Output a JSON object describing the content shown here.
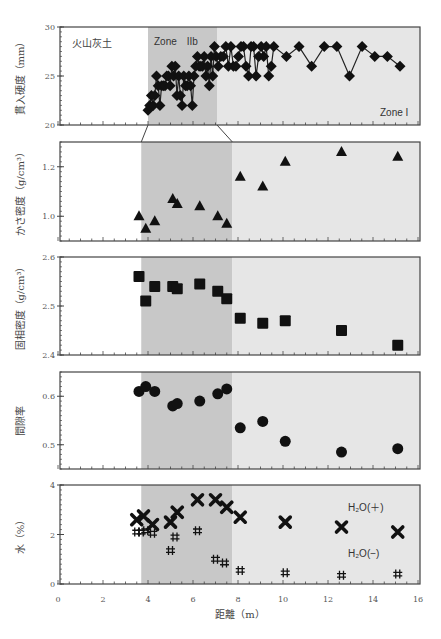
{
  "figure": {
    "xlabel": "距離（m）",
    "x_ticks": [
      "0",
      "2",
      "4",
      "6",
      "8",
      "10",
      "12",
      "14",
      "16"
    ],
    "annotations": {
      "soil_label": "火山灰土",
      "zone_2b": "Zone　IIb",
      "zone_1": "Zone I",
      "h2o_plus": "H₂O(＋)",
      "h2o_minus": "H₂O(−)"
    },
    "colors": {
      "zone_2b_fill": "#c8c8c8",
      "zone_1_fill": "#e6e6e6",
      "marker": "#111111"
    }
  },
  "chart_data": [
    {
      "type": "line",
      "title": "",
      "ylabel": "貫入硬度（mm）",
      "ylim": [
        20,
        30
      ],
      "y_ticks": [
        "20",
        "25",
        "30"
      ],
      "note": "Expanded x-scale (approx. 3.7–16 m) showing detailed profile",
      "series": [
        {
          "name": "貫入硬度",
          "marker": "diamond",
          "x": [
            3.7,
            3.8,
            3.9,
            4.0,
            4.1,
            4.2,
            4.3,
            4.4,
            4.5,
            4.6,
            4.7,
            4.8,
            4.9,
            5.0,
            5.1,
            5.2,
            5.3,
            5.4,
            5.5,
            5.6,
            5.7,
            5.8,
            5.9,
            6.0,
            6.1,
            6.2,
            6.3,
            6.4,
            6.5,
            6.6,
            6.7,
            6.8,
            6.9,
            7.0,
            7.1,
            7.2,
            7.3,
            7.4,
            7.5,
            7.6,
            7.7,
            7.8,
            7.9,
            8.0,
            8.1,
            8.2,
            8.3,
            8.4,
            8.5,
            8.6,
            8.7,
            8.8,
            8.9,
            9.0,
            9.1,
            9.2,
            9.3,
            9.4,
            9.5,
            9.6,
            9.7,
            9.8,
            9.9,
            10.0,
            10.5,
            11.0,
            11.5,
            12.0,
            12.5,
            13.0,
            13.5,
            14.0,
            14.5,
            15.0
          ],
          "values": [
            21.5,
            22,
            23,
            22,
            23,
            25,
            24,
            22,
            24,
            24,
            24,
            25,
            25,
            24,
            26,
            25,
            26,
            23,
            25,
            23,
            22,
            25,
            24,
            24,
            25,
            24,
            22,
            25,
            26,
            27,
            26,
            26,
            26,
            27,
            25,
            26,
            24,
            27,
            25,
            28,
            27,
            26,
            27,
            27,
            28,
            26,
            28,
            26,
            26,
            27,
            28,
            28,
            26,
            25,
            28,
            28,
            25,
            27,
            28,
            27,
            28,
            25,
            26,
            28,
            27,
            28,
            26,
            28,
            28,
            25,
            28,
            27,
            27,
            26
          ]
        }
      ]
    },
    {
      "type": "scatter",
      "ylabel": "かさ密度（g/cm³）",
      "ylim": [
        0.9,
        1.3
      ],
      "y_ticks": [
        "1.0",
        "1.2"
      ],
      "series": [
        {
          "name": "かさ密度",
          "marker": "triangle",
          "x": [
            3.6,
            3.9,
            4.3,
            5.1,
            5.3,
            6.3,
            7.1,
            7.5,
            8.1,
            9.1,
            10.1,
            12.6,
            15.1
          ],
          "values": [
            1.0,
            0.95,
            0.98,
            1.07,
            1.05,
            1.04,
            1.0,
            0.97,
            1.16,
            1.12,
            1.22,
            1.26,
            1.24
          ]
        }
      ]
    },
    {
      "type": "scatter",
      "ylabel": "固相密度（g/cm³）",
      "ylim": [
        2.4,
        2.6
      ],
      "y_ticks": [
        "2.4",
        "2.5",
        "2.6"
      ],
      "series": [
        {
          "name": "固相密度",
          "marker": "square",
          "x": [
            3.6,
            3.9,
            4.3,
            5.1,
            5.3,
            6.3,
            7.1,
            7.5,
            8.1,
            9.1,
            10.1,
            12.6,
            15.1
          ],
          "values": [
            2.56,
            2.51,
            2.54,
            2.54,
            2.535,
            2.545,
            2.53,
            2.515,
            2.475,
            2.465,
            2.47,
            2.45,
            2.42
          ]
        }
      ]
    },
    {
      "type": "scatter",
      "ylabel": "間隙率",
      "ylim": [
        0.45,
        0.65
      ],
      "y_ticks": [
        "0.5",
        "0.6"
      ],
      "series": [
        {
          "name": "間隙率",
          "marker": "circle",
          "x": [
            3.6,
            3.9,
            4.3,
            5.1,
            5.3,
            6.3,
            7.1,
            7.5,
            8.1,
            9.1,
            10.1,
            12.6,
            15.1
          ],
          "values": [
            0.61,
            0.62,
            0.61,
            0.58,
            0.585,
            0.59,
            0.605,
            0.615,
            0.535,
            0.548,
            0.507,
            0.485,
            0.492
          ]
        }
      ]
    },
    {
      "type": "scatter",
      "ylabel": "水（%）",
      "xlabel": "距離（m）",
      "xlim": [
        0,
        16
      ],
      "ylim": [
        0,
        4
      ],
      "y_ticks": [
        "0",
        "2",
        "4"
      ],
      "legend": [
        "H₂O(＋)",
        "H₂O(−)"
      ],
      "series": [
        {
          "name": "H₂O(＋)",
          "marker": "x",
          "x": [
            3.5,
            3.8,
            4.2,
            5.0,
            5.3,
            6.2,
            7.0,
            7.5,
            8.1,
            10.1,
            12.6,
            15.1
          ],
          "values": [
            2.6,
            2.75,
            2.4,
            2.5,
            2.9,
            3.4,
            3.4,
            3.1,
            2.7,
            2.5,
            2.3,
            2.1
          ]
        },
        {
          "name": "H₂O(−)",
          "marker": "hash",
          "x": [
            3.5,
            3.7,
            3.9,
            4.2,
            5.0,
            5.2,
            6.2,
            7.0,
            7.4,
            8.1,
            10.1,
            12.6,
            15.1
          ],
          "values": [
            2.1,
            2.1,
            2.15,
            2.05,
            1.35,
            1.9,
            2.15,
            1.0,
            0.85,
            0.55,
            0.45,
            0.35,
            0.4
          ]
        }
      ]
    }
  ]
}
